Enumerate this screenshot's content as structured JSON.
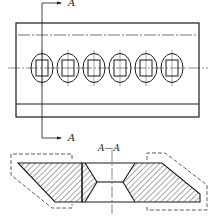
{
  "drawing": {
    "section_marker_top": "A",
    "section_marker_bottom": "A",
    "section_title": "A—A",
    "hole_count": 6,
    "line_color": "#1a1a1a"
  }
}
